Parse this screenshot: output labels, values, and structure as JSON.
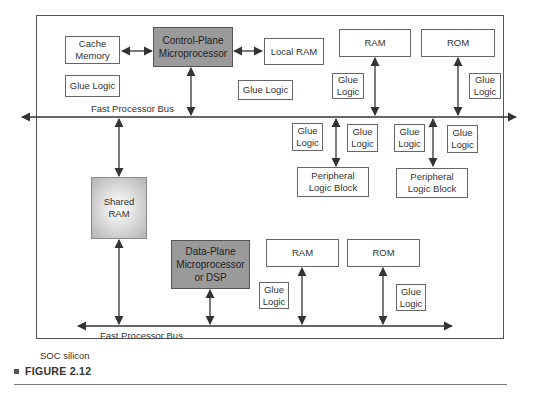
{
  "figure": {
    "caption": "FIGURE 2.12"
  },
  "container": {
    "label": "SOC silicon"
  },
  "buses": {
    "top": "Fast Processor Bus",
    "bottom": "Fast Processor Bus"
  },
  "blocks": {
    "cache_memory": "Cache\nMemory",
    "control_plane": "Control-Plane\nMicroprocessor",
    "local_ram": "Local RAM",
    "glue_logic_left": "Glue Logic",
    "glue_logic_center": "Glue Logic",
    "ram_top": "RAM",
    "rom_top": "ROM",
    "glue_ram_top": "Glue\nLogic",
    "glue_rom_top": "Glue\nLogic",
    "glue_p1_left": "Glue\nLogic",
    "glue_p1_right": "Glue\nLogic",
    "glue_p2_left": "Glue\nLogic",
    "glue_p2_right": "Glue\nLogic",
    "peripheral_1": "Peripheral\nLogic Block",
    "peripheral_2": "Peripheral\nLogic Block",
    "shared_ram": "Shared RAM",
    "data_plane": "Data-Plane\nMicroprocessor\nor DSP",
    "ram_bottom": "RAM",
    "rom_bottom": "ROM",
    "glue_ram_bottom": "Glue\nLogic",
    "glue_rom_bottom": "Glue\nLogic"
  },
  "colors": {
    "processor_fill": "#9a9a9a",
    "line": "#333333",
    "border": "#555555"
  }
}
